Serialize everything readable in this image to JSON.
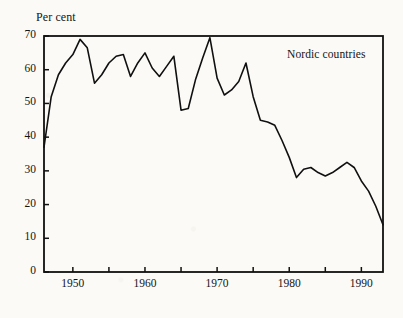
{
  "chart_data": {
    "type": "line",
    "title": "",
    "subtitle": "",
    "xlabel": "",
    "ylabel": "Per cent",
    "ylabel_position": "above-axis",
    "annotation": "Nordic countries",
    "grid": false,
    "legend": "none",
    "xlim": [
      1946,
      1993
    ],
    "ylim": [
      0,
      70
    ],
    "ytick_values": [
      0,
      10,
      20,
      30,
      40,
      50,
      60,
      70
    ],
    "ytick_labels": [
      "0",
      "10",
      "20",
      "30",
      "40",
      "50",
      "60",
      "70"
    ],
    "xtick_values": [
      1950,
      1955,
      1960,
      1965,
      1970,
      1975,
      1980,
      1985,
      1990
    ],
    "xtick_labels": [
      "1950",
      "",
      "1960",
      "",
      "1970",
      "",
      "1980",
      "",
      "1990"
    ],
    "xtick_labeled_values": [
      1950,
      1960,
      1970,
      1980,
      1990
    ],
    "xtick_interval_years": 5,
    "xtick_label_interval_years": 10,
    "series": [
      {
        "name": "Nordic countries",
        "color": "#101010",
        "line_width": 1.6,
        "x": [
          1946,
          1947,
          1948,
          1949,
          1950,
          1951,
          1952,
          1953,
          1954,
          1955,
          1956,
          1957,
          1958,
          1959,
          1960,
          1961,
          1962,
          1963,
          1964,
          1965,
          1966,
          1967,
          1968,
          1969,
          1970,
          1971,
          1972,
          1973,
          1974,
          1975,
          1976,
          1977,
          1978,
          1979,
          1980,
          1981,
          1982,
          1983,
          1984,
          1985,
          1986,
          1987,
          1988,
          1989,
          1990,
          1991,
          1992,
          1993
        ],
        "values": [
          37.0,
          52.0,
          58.5,
          62.0,
          64.5,
          69.0,
          66.5,
          56.0,
          58.5,
          62.0,
          64.0,
          64.5,
          58.0,
          62.0,
          65.0,
          60.5,
          58.0,
          61.0,
          64.0,
          48.0,
          48.5,
          57.0,
          63.5,
          69.5,
          57.5,
          52.5,
          54.0,
          56.5,
          62.0,
          52.0,
          45.0,
          44.5,
          43.5,
          39.0,
          34.0,
          28.0,
          30.5,
          31.0,
          29.5,
          28.5,
          29.5,
          31.0,
          32.5,
          31.0,
          27.0,
          24.0,
          19.5,
          14.0
        ]
      }
    ],
    "axis_style": {
      "frame": "full-box",
      "tick_direction": "inward",
      "axis_color": "#101010"
    }
  }
}
